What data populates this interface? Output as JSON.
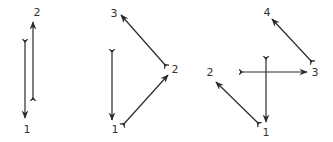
{
  "colors": {
    "stroke": "#2b2b2b",
    "label": "#333333",
    "background": "#ffffff"
  },
  "diagrams": [
    {
      "id": "diagram-1",
      "nodes": [
        {
          "label": "1",
          "x": 27,
          "y": 133
        },
        {
          "label": "2",
          "x": 37,
          "y": 16
        }
      ],
      "edges": [
        {
          "x1": 25,
          "y1": 40,
          "x2": 25,
          "y2": 118
        },
        {
          "x1": 33,
          "y1": 100,
          "x2": 33,
          "y2": 22
        }
      ]
    },
    {
      "id": "diagram-2",
      "nodes": [
        {
          "label": "1",
          "x": 115,
          "y": 133
        },
        {
          "label": "2",
          "x": 175,
          "y": 73
        },
        {
          "label": "3",
          "x": 114,
          "y": 17
        }
      ],
      "edges": [
        {
          "x1": 112,
          "y1": 50,
          "x2": 112,
          "y2": 120
        },
        {
          "x1": 123,
          "y1": 125,
          "x2": 168,
          "y2": 75
        },
        {
          "x1": 166,
          "y1": 66,
          "x2": 121,
          "y2": 15
        }
      ]
    },
    {
      "id": "diagram-3",
      "nodes": [
        {
          "label": "1",
          "x": 266,
          "y": 136
        },
        {
          "label": "2",
          "x": 210,
          "y": 76
        },
        {
          "label": "3",
          "x": 315,
          "y": 76
        },
        {
          "label": "4",
          "x": 267,
          "y": 16
        }
      ],
      "edges": [
        {
          "x1": 240,
          "y1": 72,
          "x2": 307,
          "y2": 72
        },
        {
          "x1": 266,
          "y1": 57,
          "x2": 266,
          "y2": 122
        },
        {
          "x1": 259,
          "y1": 124,
          "x2": 216,
          "y2": 82
        },
        {
          "x1": 312,
          "y1": 62,
          "x2": 272,
          "y2": 19
        }
      ]
    }
  ]
}
